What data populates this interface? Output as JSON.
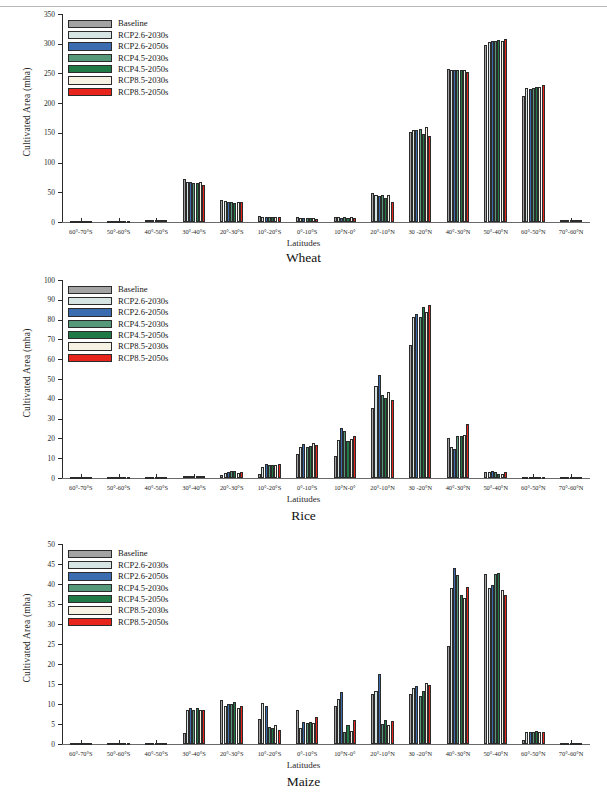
{
  "figure": {
    "series_names": [
      "Baseline",
      "RCP2.6-2030s",
      "RCP2.6-2050s",
      "RCP4.5-2030s",
      "RCP4.5-2050s",
      "RCP8.5-2030s",
      "RCP8.5-2050s"
    ],
    "series_colors": [
      "#a3a3a3",
      "#d6e4e4",
      "#3c6cb0",
      "#56997a",
      "#1f7a45",
      "#f6f3e4",
      "#e8251c"
    ],
    "axis_title_x": "Latitudes",
    "axis_title_y": "Cultivated Area (mha)"
  },
  "chart_data": [
    {
      "type": "bar",
      "title": "Wheat",
      "xlabel": "Latitudes",
      "ylabel": "Cultivated Area (mha)",
      "ylim": [
        0,
        350
      ],
      "yticks": [
        0,
        50,
        100,
        150,
        200,
        250,
        300,
        350
      ],
      "grid": false,
      "legend_position": "top-left",
      "categories": [
        "60°-70°S",
        "50°-60°S",
        "40°-50°S",
        "30°-40°S",
        "20°-30°S",
        "10°-20°S",
        "0°-10°S",
        "10°N-0°",
        "20°-10°N",
        "30 -20°N",
        "40°-30°N",
        "50°-40°N",
        "60°-50°N",
        "70°-60°N"
      ],
      "series": [
        {
          "name": "Baseline",
          "values": [
            0.2,
            0.3,
            3.6,
            72.5,
            37.0,
            9.5,
            8.6,
            9.2,
            48.5,
            151.5,
            257.5,
            297.0,
            211.5,
            3.0
          ]
        },
        {
          "name": "RCP2.6-2030s",
          "values": [
            0.2,
            0.3,
            3.8,
            67.8,
            34.5,
            9.0,
            7.0,
            8.0,
            46.0,
            154.0,
            256.5,
            303.5,
            225.0,
            3.2
          ]
        },
        {
          "name": "RCP2.6-2050s",
          "values": [
            0.2,
            0.3,
            3.9,
            67.0,
            34.0,
            8.8,
            6.5,
            7.5,
            43.0,
            154.5,
            255.0,
            304.0,
            223.5,
            3.2
          ]
        },
        {
          "name": "RCP4.5-2030s",
          "values": [
            0.2,
            0.3,
            3.8,
            66.0,
            33.5,
            8.8,
            6.5,
            7.6,
            45.5,
            156.5,
            255.0,
            305.0,
            225.5,
            3.2
          ]
        },
        {
          "name": "RCP4.5-2050s",
          "values": [
            0.2,
            0.3,
            3.7,
            65.5,
            32.5,
            8.5,
            6.2,
            7.2,
            41.0,
            148.5,
            255.0,
            305.5,
            226.5,
            3.2
          ]
        },
        {
          "name": "RCP8.5-2030s",
          "values": [
            0.2,
            0.3,
            3.9,
            67.5,
            34.0,
            9.0,
            6.8,
            7.8,
            45.0,
            160.0,
            256.0,
            305.0,
            227.0,
            3.2
          ]
        },
        {
          "name": "RCP8.5-2050s",
          "values": [
            0.2,
            0.3,
            3.5,
            62.0,
            33.5,
            9.2,
            5.8,
            7.0,
            34.0,
            144.5,
            252.5,
            308.0,
            230.0,
            3.0
          ]
        }
      ]
    },
    {
      "type": "bar",
      "title": "Rice",
      "xlabel": "Latitudes",
      "ylabel": "Cultivated Area (mha)",
      "ylim": [
        0,
        100
      ],
      "yticks": [
        0,
        10,
        20,
        30,
        40,
        50,
        60,
        70,
        80,
        90,
        100
      ],
      "grid": false,
      "legend_position": "top-left",
      "categories": [
        "60°-70°S",
        "50°-60°S",
        "40°-50°S",
        "30°-40°S",
        "20°-30°S",
        "10°-20°S",
        "0°-10°S",
        "10°N-0°",
        "20°-10°N",
        "30 -20°N",
        "40°-30°N",
        "50°-40°N",
        "60°-50°N",
        "70°-60°N"
      ],
      "series": [
        {
          "name": "Baseline",
          "values": [
            0.05,
            0.1,
            0.3,
            1.0,
            1.6,
            1.8,
            12.2,
            11.0,
            35.6,
            67.2,
            20.4,
            3.0,
            0.4,
            0.2
          ]
        },
        {
          "name": "RCP2.6-2030s",
          "values": [
            0.05,
            0.1,
            0.3,
            0.8,
            2.3,
            5.6,
            15.6,
            19.1,
            46.6,
            81.3,
            15.9,
            3.1,
            0.4,
            0.2
          ]
        },
        {
          "name": "RCP2.6-2050s",
          "values": [
            0.05,
            0.1,
            0.3,
            0.8,
            3.0,
            7.0,
            17.0,
            25.2,
            52.2,
            83.0,
            14.8,
            3.3,
            0.4,
            0.2
          ]
        },
        {
          "name": "RCP4.5-2030s",
          "values": [
            0.05,
            0.1,
            0.3,
            0.8,
            3.3,
            6.5,
            15.8,
            23.9,
            42.0,
            81.4,
            21.0,
            2.9,
            0.4,
            0.2
          ]
        },
        {
          "name": "RCP4.5-2050s",
          "values": [
            0.05,
            0.1,
            0.3,
            0.8,
            3.6,
            6.6,
            16.4,
            18.5,
            40.5,
            86.6,
            21.2,
            2.2,
            0.4,
            0.2
          ]
        },
        {
          "name": "RCP8.5-2030s",
          "values": [
            0.05,
            0.1,
            0.3,
            0.9,
            2.4,
            6.5,
            17.5,
            19.7,
            43.4,
            83.6,
            21.9,
            2.1,
            0.4,
            0.2
          ]
        },
        {
          "name": "RCP8.5-2050s",
          "values": [
            0.05,
            0.1,
            0.3,
            0.8,
            3.2,
            7.1,
            16.5,
            21.3,
            39.4,
            87.3,
            27.3,
            2.9,
            0.4,
            0.2
          ]
        }
      ]
    },
    {
      "type": "bar",
      "title": "Maize",
      "xlabel": "Latitudes",
      "ylabel": "Cultivated Area (mha)",
      "ylim": [
        0,
        50
      ],
      "yticks": [
        0,
        5,
        10,
        15,
        20,
        25,
        30,
        35,
        40,
        45,
        50
      ],
      "grid": false,
      "legend_position": "top-left",
      "categories": [
        "60°-70°S",
        "50°-60°S",
        "40°-50°S",
        "30°-40°S",
        "20°-30°S",
        "10°-20°S",
        "0°-10°S",
        "10°N-0°",
        "20°-10°N",
        "30 -20°N",
        "40°-30°N",
        "50°-40°N",
        "60°-50°N",
        "70°-60°N"
      ],
      "series": [
        {
          "name": "Baseline",
          "values": [
            0.05,
            0.05,
            0.1,
            2.8,
            11.0,
            6.3,
            8.4,
            9.5,
            12.5,
            12.5,
            24.4,
            42.6,
            0.9,
            0.15
          ]
        },
        {
          "name": "RCP2.6-2030s",
          "values": [
            0.05,
            0.05,
            0.1,
            8.6,
            9.6,
            10.2,
            3.9,
            11.2,
            13.3,
            14.0,
            39.1,
            38.9,
            2.9,
            0.15
          ]
        },
        {
          "name": "RCP2.6-2050s",
          "values": [
            0.05,
            0.05,
            0.1,
            9.0,
            10.0,
            9.6,
            5.4,
            12.9,
            17.6,
            14.6,
            44.1,
            39.7,
            3.0,
            0.15
          ]
        },
        {
          "name": "RCP4.5-2030s",
          "values": [
            0.05,
            0.05,
            0.1,
            8.4,
            10.1,
            4.2,
            5.2,
            2.9,
            5.1,
            12.0,
            42.2,
            42.4,
            3.1,
            0.15
          ]
        },
        {
          "name": "RCP4.5-2050s",
          "values": [
            0.05,
            0.05,
            0.1,
            9.0,
            10.4,
            4.1,
            5.4,
            4.8,
            6.1,
            13.2,
            37.2,
            42.7,
            3.2,
            0.15
          ]
        },
        {
          "name": "RCP8.5-2030s",
          "values": [
            0.05,
            0.05,
            0.1,
            8.6,
            8.9,
            4.8,
            5.2,
            3.2,
            4.8,
            15.2,
            36.4,
            38.4,
            3.1,
            0.15
          ]
        },
        {
          "name": "RCP8.5-2050s",
          "values": [
            0.05,
            0.05,
            0.1,
            8.5,
            9.4,
            3.5,
            6.7,
            6.0,
            5.7,
            14.7,
            39.3,
            37.3,
            3.0,
            0.15
          ]
        }
      ]
    }
  ]
}
